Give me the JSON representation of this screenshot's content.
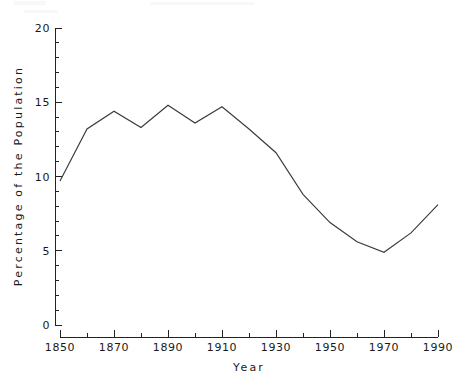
{
  "chart_data": {
    "type": "line",
    "title": "",
    "xlabel": "Year",
    "ylabel": "Percentage of the Population",
    "x": [
      1850,
      1860,
      1870,
      1880,
      1890,
      1900,
      1910,
      1920,
      1930,
      1940,
      1950,
      1960,
      1970,
      1980,
      1990
    ],
    "values": [
      9.7,
      13.2,
      14.4,
      13.3,
      14.8,
      13.6,
      14.7,
      13.2,
      11.6,
      8.8,
      6.9,
      5.6,
      4.9,
      6.2,
      8.1
    ],
    "series": [
      {
        "name": "Percentage of the Population",
        "values": [
          9.7,
          13.2,
          14.4,
          13.3,
          14.8,
          13.6,
          14.7,
          13.2,
          11.6,
          8.8,
          6.9,
          5.6,
          4.9,
          6.2,
          8.1
        ]
      }
    ],
    "xlim": [
      1850,
      1990
    ],
    "ylim": [
      0,
      20
    ],
    "x_major_ticks": [
      1850,
      1870,
      1890,
      1910,
      1930,
      1950,
      1970,
      1990
    ],
    "x_major_tick_labels": [
      "1850",
      "1870",
      "1890",
      "1910",
      "1930",
      "1950",
      "1970",
      "1990"
    ],
    "x_minor_ticks": [
      1860,
      1880,
      1900,
      1920,
      1940,
      1960,
      1980
    ],
    "y_major_ticks": [
      0,
      5,
      10,
      15,
      20
    ],
    "y_major_tick_labels": [
      "0",
      "5",
      "10",
      "15",
      "20"
    ],
    "y_minor_tick_step": 1,
    "grid": false,
    "legend": false,
    "legend_position": "none",
    "line_color": "#3a3a3a",
    "axis_color": "#222222"
  }
}
